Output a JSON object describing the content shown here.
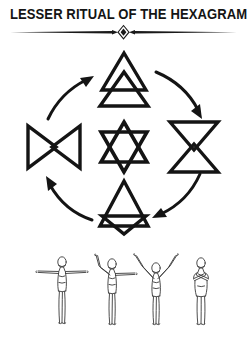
{
  "page": {
    "title": "LESSER RITUAL OF THE HEXAGRAM",
    "background_color": "#ffffff",
    "ink_color": "#141414"
  },
  "divider": {
    "ornament_name": "diamond-ornament"
  },
  "diagram": {
    "name": "hexagram-cycle-diagram",
    "center": {
      "id": "center-hexagram",
      "label": "Hexagram of the Spirit",
      "glyph_name": "six-pointed-star-hexagram",
      "cx": 124,
      "cy": 103
    },
    "hexagrams": [
      {
        "id": "fire-hexagram",
        "position": "top",
        "label": "Fire",
        "glyph_name": "fire-hexagram-glyph",
        "cx": 124,
        "cy": 38
      },
      {
        "id": "water-hexagram",
        "position": "right",
        "label": "Water",
        "glyph_name": "water-hexagram-glyph",
        "cx": 194,
        "cy": 103
      },
      {
        "id": "earth-hexagram",
        "position": "bottom",
        "label": "Earth",
        "glyph_name": "earth-hexagram-glyph",
        "cx": 124,
        "cy": 165
      },
      {
        "id": "air-hexagram",
        "position": "left",
        "label": "Air",
        "glyph_name": "air-hexagram-glyph",
        "cx": 54,
        "cy": 103
      }
    ],
    "arrows": [
      {
        "id": "arrow-air-to-fire",
        "name": "curved-arrow-up-right",
        "from": "air",
        "to": "fire"
      },
      {
        "id": "arrow-fire-to-water",
        "name": "curved-arrow-down-right",
        "from": "fire",
        "to": "water"
      },
      {
        "id": "arrow-water-to-earth",
        "name": "curved-arrow-down-left",
        "from": "water",
        "to": "earth"
      },
      {
        "id": "arrow-earth-to-air",
        "name": "curved-arrow-up-left",
        "from": "earth",
        "to": "air"
      }
    ],
    "direction": "clockwise"
  },
  "figures": {
    "name": "ritual-posture-figures",
    "items": [
      {
        "id": "figure-1",
        "label": "Arms extended horizontally",
        "posture": "cross"
      },
      {
        "id": "figure-2",
        "label": "One arm raised, one arm out",
        "posture": "half-raised"
      },
      {
        "id": "figure-3",
        "label": "Both arms raised in V",
        "posture": "arms-up-v"
      },
      {
        "id": "figure-4",
        "label": "Arms crossed on breast",
        "posture": "arms-crossed"
      }
    ]
  }
}
